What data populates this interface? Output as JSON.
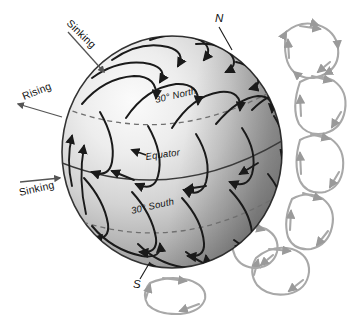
{
  "figure": {
    "background_color": "#ffffff",
    "globe": {
      "center_x": 172,
      "center_y": 152,
      "radius_x": 110,
      "radius_y": 116,
      "outline_color": "#2b2b2b",
      "highlight_color": "#f2f2f2",
      "midtone_color": "#c9c9c9",
      "shadow_color": "#8e8e8e"
    },
    "flow_line_color": "#1a1a1a",
    "cell_color": "#a8a8a8",
    "latitude_line_color": "#6f6f6f"
  },
  "labels": {
    "latitudes": [
      {
        "id": "lat-30-north",
        "text": "30° North",
        "style": "dashed"
      },
      {
        "id": "lat-equator",
        "text": "Equator",
        "style": "solid"
      },
      {
        "id": "lat-30-south",
        "text": "30° South",
        "style": "dashed"
      }
    ],
    "poles": [
      {
        "id": "pole-north",
        "text": "N"
      },
      {
        "id": "pole-south",
        "text": "S"
      }
    ],
    "annotations": [
      {
        "id": "annotation-sinking-north",
        "text": "Sinking",
        "direction": "toward-globe"
      },
      {
        "id": "annotation-rising",
        "text": "Rising",
        "direction": "away-from-globe"
      },
      {
        "id": "annotation-sinking-south",
        "text": "Sinking",
        "direction": "toward-globe"
      }
    ]
  }
}
